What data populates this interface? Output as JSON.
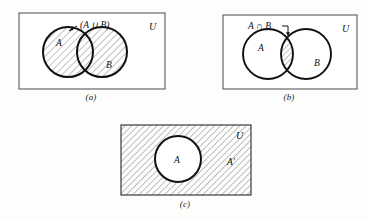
{
  "page": {
    "background_color": "#fdfdfc",
    "ink_color": "#111111",
    "hatch_color": "#4a4a4a"
  },
  "figures": [
    {
      "id": "a",
      "caption": "(a)",
      "universe_label": "U",
      "set_labels": {
        "a": "A",
        "b": "B"
      },
      "annotation": "(A ∪ B)",
      "annotation_icon": "arrow-up-left-icon",
      "shaded_region": "union",
      "rect": {
        "x": 0,
        "y": 0,
        "w": 146,
        "h": 76
      },
      "circle_a": {
        "cx": 50,
        "cy": 40,
        "r": 25
      },
      "circle_b": {
        "cx": 84,
        "cy": 40,
        "r": 25
      }
    },
    {
      "id": "b",
      "caption": "(b)",
      "universe_label": "U",
      "set_labels": {
        "a": "A",
        "b": "B"
      },
      "annotation": "A ∩ B",
      "annotation_icon": "arrow-down-right-icon",
      "shaded_region": "intersection",
      "rect": {
        "x": 0,
        "y": 0,
        "w": 134,
        "h": 74
      },
      "circle_a": {
        "cx": 46,
        "cy": 40,
        "r": 25
      },
      "circle_b": {
        "cx": 84,
        "cy": 40,
        "r": 25
      }
    },
    {
      "id": "c",
      "caption": "(c)",
      "universe_label": "U",
      "set_labels": {
        "a": "A",
        "complement": "A'"
      },
      "shaded_region": "complement",
      "rect": {
        "x": 0,
        "y": 0,
        "w": 130,
        "h": 70
      },
      "circle_a": {
        "cx": 58,
        "cy": 35,
        "r": 23
      }
    }
  ]
}
